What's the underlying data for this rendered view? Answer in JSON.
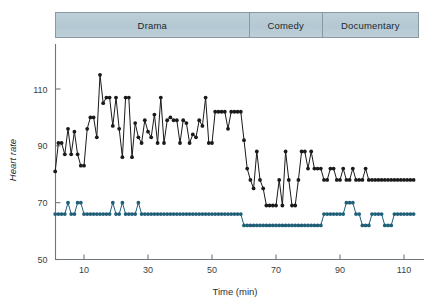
{
  "figure": {
    "background_color": "#ffffff",
    "axis_color": "#6f767b",
    "band_fill": "#b9cdd7",
    "band_border": "#8a98a0"
  },
  "phases": [
    {
      "label": "Drama",
      "start_min": 1,
      "end_min": 62
    },
    {
      "label": "Comedy",
      "start_min": 62,
      "end_min": 85
    },
    {
      "label": "Documentary",
      "start_min": 85,
      "end_min": 115
    }
  ],
  "chart_data": {
    "type": "line",
    "title": "",
    "subtitle": "",
    "xlabel": "Time (min)",
    "ylabel": "Heart rate",
    "xlim": [
      1,
      115
    ],
    "ylim": [
      50,
      118
    ],
    "xticks": [
      10,
      30,
      50,
      70,
      90,
      110
    ],
    "yticks": [
      50,
      70,
      90,
      110
    ],
    "grid": false,
    "legend": "none",
    "annotations": [
      "Drama",
      "Comedy",
      "Documentary"
    ],
    "series": [
      {
        "name": "Subject A (upper trace)",
        "color": "#1a1a1a",
        "marker": "filled-circle",
        "x": [
          1,
          2,
          3,
          4,
          5,
          6,
          7,
          8,
          9,
          10,
          11,
          12,
          13,
          14,
          15,
          16,
          17,
          18,
          19,
          20,
          21,
          22,
          23,
          24,
          25,
          26,
          27,
          28,
          29,
          30,
          31,
          32,
          33,
          34,
          35,
          36,
          37,
          38,
          39,
          40,
          41,
          42,
          43,
          44,
          45,
          46,
          47,
          48,
          49,
          50,
          51,
          52,
          53,
          54,
          55,
          56,
          57,
          58,
          59,
          60,
          61,
          62,
          63,
          64,
          65,
          66,
          67,
          68,
          69,
          70,
          71,
          72,
          73,
          74,
          75,
          76,
          77,
          78,
          79,
          80,
          81,
          82,
          83,
          84,
          85,
          86,
          87,
          88,
          89,
          90,
          91,
          92,
          93,
          94,
          95,
          96,
          97,
          98,
          99,
          100,
          101,
          102,
          103,
          104,
          105,
          106,
          107,
          108,
          109,
          110,
          111,
          112,
          113
        ],
        "y": [
          81,
          91,
          91,
          87,
          96,
          87,
          95,
          87,
          83,
          83,
          96,
          100,
          100,
          93,
          115,
          105,
          107,
          107,
          97,
          107,
          96,
          86,
          107,
          107,
          86,
          98,
          93,
          91,
          99,
          95,
          93,
          101,
          91,
          107,
          91,
          99,
          100,
          99,
          99,
          91,
          99,
          98,
          91,
          94,
          93,
          99,
          97,
          107,
          91,
          91,
          102,
          102,
          102,
          102,
          96,
          102,
          102,
          102,
          102,
          92,
          82,
          78,
          75,
          88,
          78,
          75,
          69,
          69,
          69,
          69,
          78,
          69,
          88,
          78,
          69,
          69,
          78,
          88,
          88,
          82,
          88,
          82,
          82,
          82,
          78,
          78,
          82,
          82,
          78,
          78,
          82,
          78,
          78,
          82,
          78,
          78,
          78,
          82,
          78,
          78,
          78,
          78,
          78,
          78,
          78,
          78,
          78,
          78,
          78,
          78,
          78,
          78,
          78
        ]
      },
      {
        "name": "Subject B (lower trace)",
        "color": "#1f5f78",
        "marker": "filled-circle",
        "x": [
          1,
          2,
          3,
          4,
          5,
          6,
          7,
          8,
          9,
          10,
          11,
          12,
          13,
          14,
          15,
          16,
          17,
          18,
          19,
          20,
          21,
          22,
          23,
          24,
          25,
          26,
          27,
          28,
          29,
          30,
          31,
          32,
          33,
          34,
          35,
          36,
          37,
          38,
          39,
          40,
          41,
          42,
          43,
          44,
          45,
          46,
          47,
          48,
          49,
          50,
          51,
          52,
          53,
          54,
          55,
          56,
          57,
          58,
          59,
          60,
          61,
          62,
          63,
          64,
          65,
          66,
          67,
          68,
          69,
          70,
          71,
          72,
          73,
          74,
          75,
          76,
          77,
          78,
          79,
          80,
          81,
          82,
          83,
          84,
          85,
          86,
          87,
          88,
          89,
          90,
          91,
          92,
          93,
          94,
          95,
          96,
          97,
          98,
          99,
          100,
          101,
          102,
          103,
          104,
          105,
          106,
          107,
          108,
          109,
          110,
          111,
          112,
          113
        ],
        "y": [
          66,
          66,
          66,
          66,
          70,
          66,
          66,
          70,
          70,
          66,
          66,
          66,
          66,
          66,
          66,
          66,
          66,
          66,
          70,
          66,
          66,
          70,
          66,
          66,
          66,
          66,
          70,
          66,
          66,
          66,
          66,
          66,
          66,
          66,
          66,
          66,
          66,
          66,
          66,
          66,
          66,
          66,
          66,
          66,
          66,
          66,
          66,
          66,
          66,
          66,
          66,
          66,
          66,
          66,
          66,
          66,
          66,
          66,
          66,
          62,
          62,
          62,
          62,
          62,
          62,
          62,
          62,
          62,
          62,
          62,
          62,
          62,
          62,
          62,
          62,
          62,
          62,
          62,
          62,
          62,
          62,
          62,
          62,
          62,
          66,
          66,
          66,
          66,
          66,
          66,
          66,
          70,
          70,
          70,
          66,
          66,
          62,
          62,
          62,
          66,
          66,
          66,
          66,
          62,
          62,
          62,
          66,
          66,
          66,
          66,
          66,
          66,
          66
        ]
      }
    ]
  }
}
